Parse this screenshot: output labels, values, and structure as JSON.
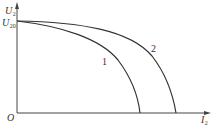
{
  "diagram": {
    "title": "",
    "axes": {
      "y_label_main": "U",
      "y_label_sub": "2",
      "y_intercept_label_main": "U",
      "y_intercept_label_sub": "20",
      "x_label_main": "I",
      "x_label_sub": "2",
      "origin_label": "O"
    },
    "curves": [
      {
        "id": "1",
        "label": "1",
        "description": "steeper drop characteristic, reaches I2 axis first"
      },
      {
        "id": "2",
        "label": "2",
        "description": "softer drop characteristic, reaches I2 axis further out"
      }
    ],
    "colors": {
      "axis": "#444444",
      "curve": "#333333",
      "text": "#333333",
      "background": "#ffffff"
    }
  }
}
